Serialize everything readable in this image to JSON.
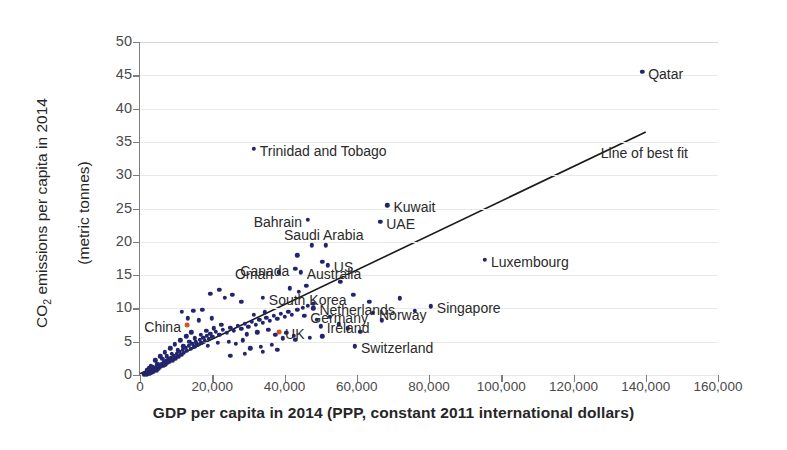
{
  "chart_data": {
    "type": "scatter",
    "title": "",
    "xlabel": "GDP per capita in 2014 (PPP, constant 2011 international dollars)",
    "ylabel": "CO₂ emissions per capita in 2014\n(metric tonnes)",
    "ylabel_line1": "CO",
    "ylabel_sub": "2",
    "ylabel_rest": " emissions per capita in 2014",
    "ylabel_line2": "(metric tonnes)",
    "xlim": [
      0,
      160000
    ],
    "ylim": [
      0,
      50
    ],
    "xticks": [
      0,
      20000,
      40000,
      60000,
      80000,
      100000,
      120000,
      140000,
      160000
    ],
    "xtick_labels": [
      "0",
      "20,000",
      "40,000",
      "60,000",
      "80,000",
      "100,000",
      "120,000",
      "140,000",
      "160,000"
    ],
    "yticks": [
      0,
      5,
      10,
      15,
      20,
      25,
      30,
      35,
      40,
      45,
      50
    ],
    "ytick_labels": [
      "0",
      "5",
      "10",
      "15",
      "20",
      "25",
      "30",
      "35",
      "40",
      "45",
      "50"
    ],
    "grid": true,
    "legend": false,
    "point_color": "#22256b",
    "highlight_color": "#d9521f",
    "fit_line_color": "#1a1a1a",
    "grid_color": "#e9e9e9",
    "fit_line": {
      "label": "Line of best fit",
      "x_start": 0,
      "y_start": 0.2,
      "x_end": 140000,
      "y_end": 36.5
    },
    "annotations": [
      {
        "name": "Qatar",
        "x": 139000,
        "y": 45.5,
        "label_side": "right"
      },
      {
        "name": "Trinidad and Tobago",
        "x": 31500,
        "y": 34.0,
        "label_side": "right"
      },
      {
        "name": "Kuwait",
        "x": 68500,
        "y": 25.5,
        "label_side": "right"
      },
      {
        "name": "Bahrain",
        "x": 46500,
        "y": 23.3,
        "label_side": "left"
      },
      {
        "name": "UAE",
        "x": 66500,
        "y": 23.0,
        "label_side": "right"
      },
      {
        "name": "Saudi Arabia",
        "x": 51500,
        "y": 19.5,
        "label_side": "below"
      },
      {
        "name": "Canada",
        "x": 43000,
        "y": 15.9,
        "label_side": "left"
      },
      {
        "name": "US",
        "x": 52000,
        "y": 16.5,
        "label_side": "right"
      },
      {
        "name": "Oman",
        "x": 38500,
        "y": 15.4,
        "label_side": "left"
      },
      {
        "name": "Luxembourg",
        "x": 95500,
        "y": 17.3,
        "label_side": "right"
      },
      {
        "name": "Australia",
        "x": 44500,
        "y": 15.4,
        "label_side": "right"
      },
      {
        "name": "South Korea",
        "x": 34000,
        "y": 11.6,
        "label_side": "right"
      },
      {
        "name": "Netherlands",
        "x": 48000,
        "y": 10.0,
        "label_side": "right"
      },
      {
        "name": "Singapore",
        "x": 80500,
        "y": 10.3,
        "label_side": "right"
      },
      {
        "name": "Germany",
        "x": 45500,
        "y": 8.9,
        "label_side": "right"
      },
      {
        "name": "Norway",
        "x": 64500,
        "y": 9.3,
        "label_side": "right"
      },
      {
        "name": "China",
        "x": 13000,
        "y": 7.5,
        "label_side": "left",
        "highlight": true
      },
      {
        "name": "UK",
        "x": 38500,
        "y": 6.5,
        "label_side": "right",
        "highlight": true
      },
      {
        "name": "Ireland",
        "x": 50000,
        "y": 7.3,
        "label_side": "right"
      },
      {
        "name": "Switzerland",
        "x": 59500,
        "y": 4.3,
        "label_side": "right"
      }
    ],
    "points": [
      {
        "x": 1200,
        "y": 0.1
      },
      {
        "x": 1500,
        "y": 0.15
      },
      {
        "x": 1700,
        "y": 0.2
      },
      {
        "x": 1900,
        "y": 0.1
      },
      {
        "x": 2100,
        "y": 0.3
      },
      {
        "x": 2300,
        "y": 0.2
      },
      {
        "x": 2500,
        "y": 0.4
      },
      {
        "x": 2700,
        "y": 0.25
      },
      {
        "x": 2900,
        "y": 0.5
      },
      {
        "x": 3100,
        "y": 0.35
      },
      {
        "x": 3300,
        "y": 0.6
      },
      {
        "x": 3500,
        "y": 0.45
      },
      {
        "x": 3700,
        "y": 0.8
      },
      {
        "x": 3900,
        "y": 0.55
      },
      {
        "x": 4100,
        "y": 0.9
      },
      {
        "x": 4300,
        "y": 1.1
      },
      {
        "x": 4600,
        "y": 0.7
      },
      {
        "x": 4900,
        "y": 1.3
      },
      {
        "x": 5200,
        "y": 1.0
      },
      {
        "x": 5500,
        "y": 1.5
      },
      {
        "x": 5800,
        "y": 1.2
      },
      {
        "x": 6100,
        "y": 1.7
      },
      {
        "x": 6400,
        "y": 1.4
      },
      {
        "x": 6700,
        "y": 1.9
      },
      {
        "x": 7000,
        "y": 1.6
      },
      {
        "x": 7300,
        "y": 2.1
      },
      {
        "x": 7600,
        "y": 1.8
      },
      {
        "x": 7900,
        "y": 2.4
      },
      {
        "x": 8200,
        "y": 2.0
      },
      {
        "x": 8600,
        "y": 2.6
      },
      {
        "x": 9000,
        "y": 2.2
      },
      {
        "x": 9400,
        "y": 2.9
      },
      {
        "x": 9800,
        "y": 2.5
      },
      {
        "x": 10200,
        "y": 3.2
      },
      {
        "x": 10600,
        "y": 2.7
      },
      {
        "x": 11000,
        "y": 3.5
      },
      {
        "x": 11400,
        "y": 3.0
      },
      {
        "x": 11800,
        "y": 3.8
      },
      {
        "x": 12200,
        "y": 3.3
      },
      {
        "x": 12600,
        "y": 4.1
      },
      {
        "x": 13000,
        "y": 3.6
      },
      {
        "x": 13500,
        "y": 4.4
      },
      {
        "x": 14000,
        "y": 3.9
      },
      {
        "x": 14500,
        "y": 4.7
      },
      {
        "x": 15000,
        "y": 4.2
      },
      {
        "x": 15500,
        "y": 5.0
      },
      {
        "x": 16000,
        "y": 4.5
      },
      {
        "x": 16500,
        "y": 5.3
      },
      {
        "x": 17000,
        "y": 4.8
      },
      {
        "x": 17500,
        "y": 5.6
      },
      {
        "x": 18000,
        "y": 5.1
      },
      {
        "x": 18500,
        "y": 5.9
      },
      {
        "x": 19000,
        "y": 5.4
      },
      {
        "x": 19500,
        "y": 6.2
      },
      {
        "x": 20000,
        "y": 5.7
      },
      {
        "x": 21000,
        "y": 6.5
      },
      {
        "x": 22000,
        "y": 6.0
      },
      {
        "x": 23000,
        "y": 6.8
      },
      {
        "x": 24000,
        "y": 6.3
      },
      {
        "x": 25000,
        "y": 7.1
      },
      {
        "x": 26000,
        "y": 6.6
      },
      {
        "x": 27000,
        "y": 7.4
      },
      {
        "x": 28000,
        "y": 6.9
      },
      {
        "x": 29000,
        "y": 7.7
      },
      {
        "x": 30000,
        "y": 7.2
      },
      {
        "x": 31000,
        "y": 8.0
      },
      {
        "x": 32000,
        "y": 7.5
      },
      {
        "x": 33000,
        "y": 8.3
      },
      {
        "x": 34000,
        "y": 7.8
      },
      {
        "x": 35000,
        "y": 8.6
      },
      {
        "x": 36000,
        "y": 8.1
      },
      {
        "x": 37000,
        "y": 8.9
      },
      {
        "x": 38000,
        "y": 8.4
      },
      {
        "x": 39000,
        "y": 9.2
      },
      {
        "x": 40000,
        "y": 8.7
      },
      {
        "x": 41000,
        "y": 9.5
      },
      {
        "x": 42000,
        "y": 9.0
      },
      {
        "x": 43500,
        "y": 9.8
      },
      {
        "x": 45000,
        "y": 10.1
      },
      {
        "x": 46500,
        "y": 10.4
      },
      {
        "x": 48000,
        "y": 10.7
      },
      {
        "x": 3000,
        "y": 1.4
      },
      {
        "x": 4200,
        "y": 2.2
      },
      {
        "x": 5600,
        "y": 2.8
      },
      {
        "x": 6800,
        "y": 3.4
      },
      {
        "x": 8400,
        "y": 4.0
      },
      {
        "x": 9600,
        "y": 4.6
      },
      {
        "x": 11200,
        "y": 5.2
      },
      {
        "x": 12800,
        "y": 5.8
      },
      {
        "x": 14200,
        "y": 6.4
      },
      {
        "x": 2000,
        "y": 0.8
      },
      {
        "x": 2600,
        "y": 1.0
      },
      {
        "x": 3400,
        "y": 1.2
      },
      {
        "x": 4800,
        "y": 1.6
      },
      {
        "x": 6200,
        "y": 2.4
      },
      {
        "x": 7400,
        "y": 2.8
      },
      {
        "x": 8800,
        "y": 3.2
      },
      {
        "x": 10400,
        "y": 3.7
      },
      {
        "x": 12000,
        "y": 4.3
      },
      {
        "x": 13600,
        "y": 5.0
      },
      {
        "x": 15200,
        "y": 5.5
      },
      {
        "x": 16800,
        "y": 6.0
      },
      {
        "x": 18400,
        "y": 6.6
      },
      {
        "x": 20500,
        "y": 7.0
      },
      {
        "x": 22500,
        "y": 7.5
      },
      {
        "x": 11500,
        "y": 9.5
      },
      {
        "x": 14800,
        "y": 9.6
      },
      {
        "x": 17200,
        "y": 9.8
      },
      {
        "x": 13200,
        "y": 8.5
      },
      {
        "x": 16200,
        "y": 8.2
      },
      {
        "x": 19800,
        "y": 8.5
      },
      {
        "x": 15800,
        "y": 4.6
      },
      {
        "x": 18800,
        "y": 4.4
      },
      {
        "x": 21500,
        "y": 4.8
      },
      {
        "x": 24500,
        "y": 5.0
      },
      {
        "x": 26500,
        "y": 4.7
      },
      {
        "x": 28500,
        "y": 5.2
      },
      {
        "x": 23500,
        "y": 11.6
      },
      {
        "x": 25500,
        "y": 12.0
      },
      {
        "x": 28000,
        "y": 11.0
      },
      {
        "x": 22000,
        "y": 12.8
      },
      {
        "x": 19500,
        "y": 12.2
      },
      {
        "x": 30500,
        "y": 4.0
      },
      {
        "x": 33500,
        "y": 4.2
      },
      {
        "x": 36500,
        "y": 4.5
      },
      {
        "x": 31500,
        "y": 9.0
      },
      {
        "x": 34500,
        "y": 9.4
      },
      {
        "x": 37500,
        "y": 6.0
      },
      {
        "x": 40500,
        "y": 6.3
      },
      {
        "x": 42500,
        "y": 5.9
      },
      {
        "x": 39500,
        "y": 5.5
      },
      {
        "x": 35500,
        "y": 6.8
      },
      {
        "x": 32500,
        "y": 6.4
      },
      {
        "x": 29500,
        "y": 6.1
      },
      {
        "x": 44000,
        "y": 12.5
      },
      {
        "x": 41500,
        "y": 13.0
      },
      {
        "x": 46000,
        "y": 13.4
      },
      {
        "x": 49000,
        "y": 8.3
      },
      {
        "x": 52500,
        "y": 8.7
      },
      {
        "x": 55000,
        "y": 7.6
      },
      {
        "x": 57500,
        "y": 7.0
      },
      {
        "x": 61000,
        "y": 6.5
      },
      {
        "x": 50500,
        "y": 5.8
      },
      {
        "x": 47000,
        "y": 5.6
      },
      {
        "x": 43000,
        "y": 5.3
      },
      {
        "x": 38000,
        "y": 3.8
      },
      {
        "x": 34000,
        "y": 3.5
      },
      {
        "x": 29000,
        "y": 3.2
      },
      {
        "x": 25000,
        "y": 2.9
      },
      {
        "x": 47500,
        "y": 19.5
      },
      {
        "x": 43500,
        "y": 18.0
      },
      {
        "x": 50500,
        "y": 17.0
      },
      {
        "x": 55500,
        "y": 14.0
      },
      {
        "x": 59000,
        "y": 12.0
      },
      {
        "x": 63500,
        "y": 11.0
      },
      {
        "x": 72000,
        "y": 11.5
      },
      {
        "x": 76000,
        "y": 9.6
      },
      {
        "x": 67000,
        "y": 8.2
      }
    ]
  }
}
